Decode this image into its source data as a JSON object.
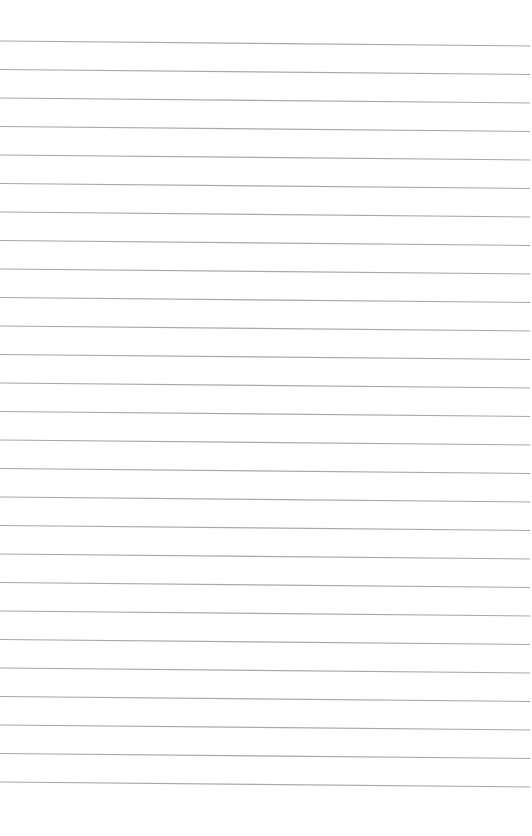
{
  "page": {
    "type": "lined-paper",
    "width": 532,
    "height": 836,
    "background_color": "#ffffff"
  },
  "rules": {
    "count": 27,
    "first_y_left": 41,
    "first_y_right": 46,
    "spacing": 28.5,
    "x_start": 0,
    "x_end": 530,
    "line_color": "#a8a8a8",
    "line_width": 1.1
  }
}
